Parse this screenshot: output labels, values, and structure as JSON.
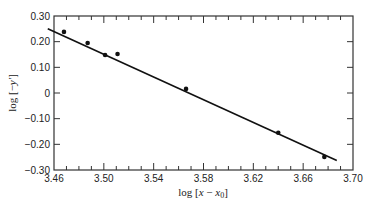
{
  "chart_data": {
    "type": "scatter",
    "title": "",
    "xlabel": "log [x − x0]",
    "ylabel": "log [−y′]",
    "xlim": [
      3.46,
      3.7
    ],
    "ylim": [
      -0.3,
      0.3
    ],
    "grid": false,
    "legend": null,
    "x_ticks_major": [
      3.46,
      3.5,
      3.54,
      3.58,
      3.62,
      3.66,
      3.7
    ],
    "x_tick_labels": [
      "3.46",
      "3.50",
      "3.54",
      "3.58",
      "3.62",
      "3.66",
      "3.70"
    ],
    "x_ticks_minor_step": 0.01,
    "y_ticks": [
      0.3,
      0.2,
      0.1,
      0,
      -0.1,
      -0.2,
      -0.3
    ],
    "y_tick_labels": [
      "0.30",
      "0.20",
      "0.10",
      "0",
      "−0.10",
      "−0.20",
      "−0.30"
    ],
    "series": [
      {
        "name": "data points",
        "type": "scatter",
        "x": [
          3.468,
          3.487,
          3.501,
          3.511,
          3.566,
          3.64,
          3.677
        ],
        "y": [
          0.238,
          0.195,
          0.148,
          0.152,
          0.016,
          -0.155,
          -0.249
        ]
      },
      {
        "name": "fit line",
        "type": "line",
        "x": [
          3.455,
          3.687
        ],
        "y": [
          0.25,
          -0.263
        ]
      }
    ]
  },
  "labels": {
    "xlabel_prefix": "log [",
    "xlabel_var": "x",
    "xlabel_mid": " − ",
    "xlabel_var2": "x",
    "xlabel_sub": "0",
    "xlabel_suffix": "]",
    "ylabel_prefix": "log [−",
    "ylabel_var": "y′",
    "ylabel_suffix": "]"
  }
}
